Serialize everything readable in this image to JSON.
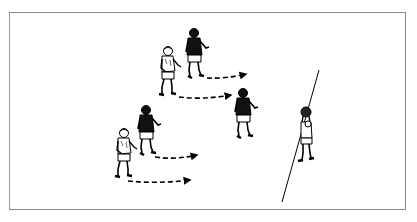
{
  "diagram": {
    "type": "rugby-drill-illustration",
    "colors": {
      "ink": "#000000",
      "dark_jersey": "#111111",
      "light_jersey": "#ffffff",
      "frame_border": "#8a8a8a",
      "background": "#ffffff"
    },
    "touchline": {
      "x1": 319,
      "y1": 70,
      "x2": 282,
      "y2": 202
    },
    "players": [
      {
        "id": "p1",
        "jersey": "light",
        "x": 124,
        "y": 128,
        "scale": 1.0
      },
      {
        "id": "p2",
        "jersey": "dark",
        "x": 146,
        "y": 105,
        "scale": 1.0
      },
      {
        "id": "p3",
        "jersey": "light",
        "x": 168,
        "y": 46,
        "scale": 1.0
      },
      {
        "id": "p4",
        "jersey": "dark",
        "x": 194,
        "y": 28,
        "scale": 1.0
      },
      {
        "id": "p5",
        "jersey": "dark",
        "x": 243,
        "y": 88,
        "scale": 1.0
      },
      {
        "id": "thrower",
        "jersey": "light",
        "x": 306,
        "y": 108,
        "scale": 1.0
      }
    ],
    "arrows": [
      {
        "from": [
          207,
          78
        ],
        "to": [
          246,
          74
        ]
      },
      {
        "from": [
          179,
          97
        ],
        "to": [
          231,
          95
        ]
      },
      {
        "from": [
          155,
          157
        ],
        "to": [
          197,
          155
        ]
      },
      {
        "from": [
          128,
          181
        ],
        "to": [
          190,
          180
        ]
      }
    ]
  }
}
